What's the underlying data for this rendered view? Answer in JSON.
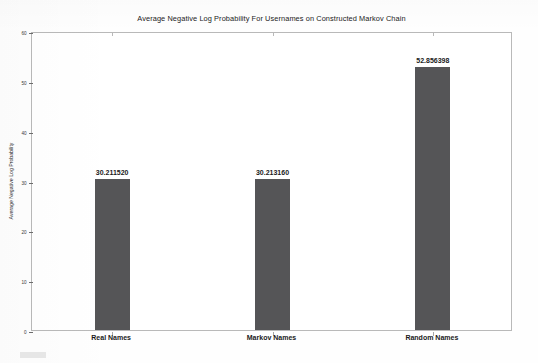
{
  "chart_data": {
    "type": "bar",
    "title": "Average Negative Log Probability For Usernames on Constructed Markov Chain",
    "xlabel": "",
    "ylabel": "Average Negative Log Probability",
    "categories": [
      "Real Names",
      "Markov Names",
      "Random Names"
    ],
    "values": [
      30.21152,
      30.21316,
      52.856398
    ],
    "data_labels": [
      "30.211520",
      "30.213160",
      "52.856398"
    ],
    "ylim": [
      0,
      60
    ],
    "yticks": [
      0,
      10,
      20,
      30,
      40,
      50,
      60
    ],
    "ytick_labels": [
      "0",
      "10",
      "20",
      "30",
      "40",
      "50",
      "60"
    ],
    "grid": false,
    "legend": null,
    "bar_color": "#555557",
    "frame_color": "#b9b9b9",
    "background_color": "#ffffff"
  },
  "figure": {
    "title": "Average Negative Log Probability For Usernames on Constructed Markov Chain",
    "y_axis_title": "Average Negative Log Probability"
  }
}
